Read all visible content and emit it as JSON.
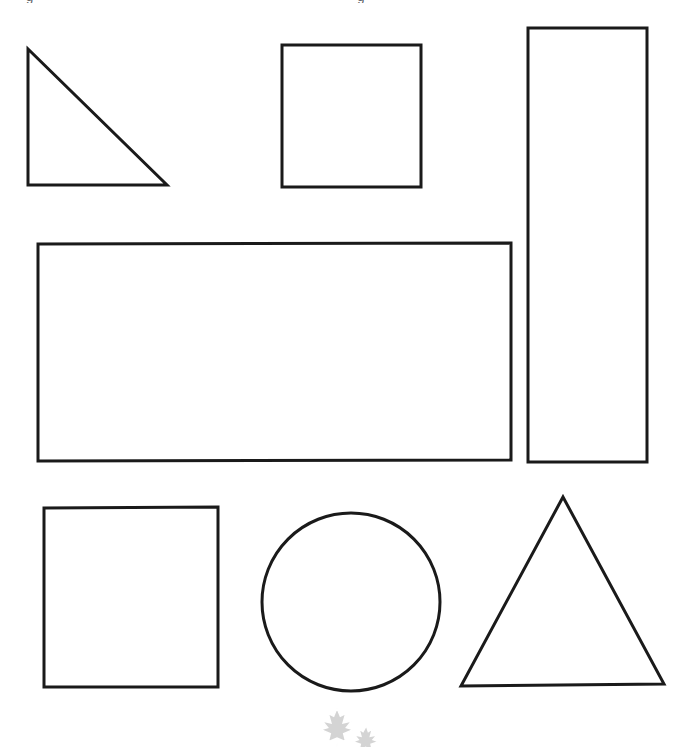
{
  "page": {
    "background_color": "#ffffff",
    "stroke_color": "#1a1a1a",
    "width": 695,
    "height": 740
  },
  "header": {
    "clipped_text_left": "g",
    "clipped_text_right": "g",
    "note": "text clipped at top edge of page"
  },
  "watermark": {
    "name": "maple-leaf-watermark",
    "color": "#9a9a9a",
    "label": "maple leaf"
  },
  "shapes": [
    {
      "id": "right-triangle",
      "name": "right-triangle",
      "type": "polygon",
      "label": "Right triangle",
      "points": "28,49 28,185 167,185",
      "stroke": "#1a1a1a",
      "stroke_width": 3,
      "fill": "none",
      "row": 1,
      "column": 1
    },
    {
      "id": "small-square-top",
      "name": "square-top",
      "type": "polygon",
      "label": "Square",
      "points": "282,45 421,45 421,187 282,187",
      "stroke": "#1a1a1a",
      "stroke_width": 3,
      "fill": "none",
      "row": 1,
      "column": 2
    },
    {
      "id": "tall-rectangle",
      "name": "tall-rectangle",
      "type": "polygon",
      "label": "Tall rectangle",
      "points": "528,28 647,28 647,462 528,462",
      "stroke": "#1a1a1a",
      "stroke_width": 3,
      "fill": "none",
      "row": 1,
      "column": 3
    },
    {
      "id": "wide-rectangle",
      "name": "wide-rectangle",
      "type": "polygon",
      "label": "Wide rectangle",
      "points": "38,244 511,243 511,460 38,461",
      "stroke": "#1a1a1a",
      "stroke_width": 3,
      "fill": "none",
      "row": 2,
      "column": 1
    },
    {
      "id": "square-bottom",
      "name": "square-bottom",
      "type": "polygon",
      "label": "Square",
      "points": "44,508 218,507 218,687 44,687",
      "stroke": "#1a1a1a",
      "stroke_width": 3,
      "fill": "none",
      "row": 3,
      "column": 1
    },
    {
      "id": "circle",
      "name": "circle",
      "type": "circle",
      "label": "Circle",
      "cx": 351,
      "cy": 602,
      "r": 89,
      "stroke": "#1a1a1a",
      "stroke_width": 3,
      "fill": "none",
      "row": 3,
      "column": 2
    },
    {
      "id": "equilateral-triangle",
      "name": "equilateral-triangle",
      "type": "polygon",
      "label": "Triangle",
      "points": "563,497 664,684 461,686",
      "stroke": "#1a1a1a",
      "stroke_width": 3,
      "fill": "none",
      "row": 3,
      "column": 3
    }
  ]
}
